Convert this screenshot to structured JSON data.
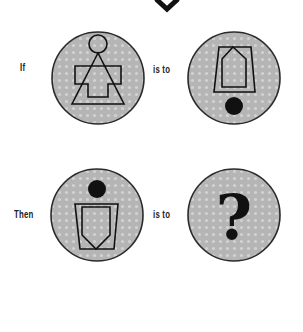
{
  "puzzle": {
    "type": "visual analogy",
    "rows": [
      {
        "prefix": "If",
        "relation": "is to",
        "left_figure": {
          "name": "stick-figure-circle-triangle-cross",
          "elements": [
            "circle",
            "triangle",
            "cross"
          ]
        },
        "right_figure": {
          "name": "pentagon-in-trapezoid-with-dot-below",
          "elements": [
            "trapezoid",
            "pentagon",
            "filled-dot"
          ]
        }
      },
      {
        "prefix": "Then",
        "relation": "is to",
        "left_figure": {
          "name": "dot-above-shield-in-trapezoid",
          "elements": [
            "filled-dot",
            "trapezoid",
            "shield"
          ]
        },
        "right_figure": {
          "name": "question-mark",
          "symbol": "?"
        }
      }
    ]
  },
  "colors": {
    "disc_fill": "#b9b9b9",
    "disc_stroke": "#2a2a2a",
    "ink": "#111111",
    "background": "#ffffff"
  }
}
